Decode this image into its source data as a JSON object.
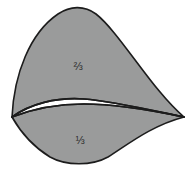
{
  "figure": {
    "background_color": "#ffffff",
    "fill_color": "#9a9b9b",
    "stroke_color": "#1c1c1c",
    "stroke_width": 1.6,
    "label_color": "#2b2b2b",
    "canvas": {
      "width": 193,
      "height": 169
    }
  },
  "regions": [
    {
      "name": "upper-lobe",
      "label": "⅔",
      "label_text_plain": "2/3",
      "label_x": 78,
      "label_y": 67,
      "fill": "#9a9b9b"
    },
    {
      "name": "lower-lobe",
      "label": "⅓",
      "label_text_plain": "1/3",
      "label_x": 80,
      "label_y": 141,
      "fill": "#9a9b9b"
    },
    {
      "name": "inner-lens",
      "label": "",
      "fill": "#ffffff"
    }
  ],
  "cusps": [
    {
      "name": "left-cusp",
      "x": 12,
      "y": 117
    },
    {
      "name": "right-cusp",
      "x": 184,
      "y": 117
    }
  ],
  "paths": {
    "upper_lobe": "M 12 117 C 14 74 30 33 58 14 C 70 6 84 5 96 14 C 120 33 152 90 184 117 C 150 110 112 101 84 99 C 56 97 30 104 12 117 Z",
    "lower_lobe": "M 12 117 C 30 110 56 104 84 104 C 112 104 150 110 184 117 C 150 126 126 146 108 157 C 92 166 66 166 50 157 C 32 146 20 131 12 117 Z",
    "lens_upper_edge": "M 12 117 C 30 104 56 97 84 99 C 112 101 150 110 184 117",
    "lens_lower_edge": "M 12 117 C 30 110 56 104 84 104 C 112 104 150 110 184 117"
  }
}
